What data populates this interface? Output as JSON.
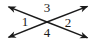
{
  "figure": {
    "background_color": "#ffffff",
    "stroke_color": "#1a1a1a",
    "label_color": "#1a1a1a",
    "width": 96,
    "height": 44
  },
  "diagram": {
    "type": "intersecting-lines",
    "intersection": {
      "x": 47,
      "y": 22
    },
    "lines": [
      {
        "name": "line-upper-left-to-lower-right",
        "from": {
          "x": 7,
          "y": 6
        },
        "to": {
          "x": 89,
          "y": 38
        },
        "arrow_start": true,
        "arrow_end": true
      },
      {
        "name": "line-lower-left-to-upper-right",
        "from": {
          "x": 7,
          "y": 38
        },
        "to": {
          "x": 89,
          "y": 6
        },
        "arrow_start": true,
        "arrow_end": true
      }
    ],
    "labels": [
      {
        "name": "angle-label-1",
        "text": "1",
        "x": 25,
        "y": 23,
        "position": "left"
      },
      {
        "name": "angle-label-2",
        "text": "2",
        "x": 68,
        "y": 24,
        "position": "right"
      },
      {
        "name": "angle-label-3",
        "text": "3",
        "x": 47,
        "y": 10,
        "position": "top"
      },
      {
        "name": "angle-label-4",
        "text": "4",
        "x": 47,
        "y": 34,
        "position": "bottom"
      }
    ]
  }
}
